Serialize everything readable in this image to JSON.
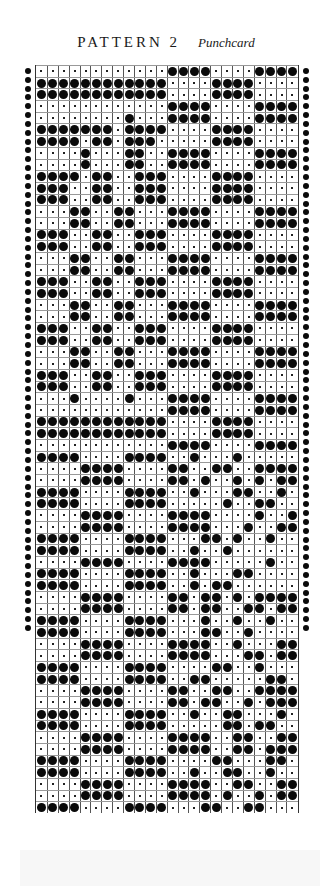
{
  "header": {
    "title": "PATTERN 2",
    "subtitle": "Punchcard"
  },
  "punchcard": {
    "columns": 24,
    "legend": {
      "X": "punched hole",
      ".": "unpunched"
    },
    "rows": [
      "............XXXX....XXXX",
      "XXXXXXXXXXXX....XXXX....",
      "XXXXXXXXXXXX....XXXX....",
      "............XXXX....XXXX",
      "........X...XXXX....XXXX",
      "XXXXXXX.XXXX....XXXX....",
      "XXXX.XX.XXX.....XXXX....",
      "....X...XX..XXXX....XXXX",
      "....X...XX..XXXX....XXXX",
      "XXXX.XX..XXX....XXXX....",
      "XXX..XX..XXX....XXXX....",
      "XXX..XX..XXX....XXXX....",
      "...XX..XX...XXXX....XXXX",
      "...XX..XX...XXXX....XXXX",
      "XXX..XX..XXX....XXXX....",
      "XXX..XX..XXX....XXXX....",
      "...XX..XX...XXXX....XXXX",
      "...XX..XX...XXXX....XXXX",
      "XXX..XX..XXX....XXXX....",
      "XXX..XX..XXX....XXXX....",
      "...XX..XX...XXXX....XXXX",
      "...XX..XX...XXXX....XXXX",
      "XXX..XX..XXX....XXXX....",
      "XXX..XX..XXX....XXXX....",
      "...XX..XX...XXXX....XXXX",
      "...XX..XX...XXXX....XXXX",
      "XXX..XX..XXX....XXXX....",
      "XXX..XX..XXX....XXXX....",
      "...X....X...XXXX....XXXX",
      "............XXXX....XXXX",
      "XXXXXXXXXXXX....XXXX....",
      "XXXXXXXXXXXX....XXXX....",
      "............XXXX....XXXX",
      "XXXX....XXXX..X...X.....",
      "....XXXX....XX..XX..XXXX",
      "....XXXX....XX.X..X.X.XX",
      "XXXX....XXXX..X...XX..X.",
      "XXXX....XXXX.....X..XX..",
      "....XXXX....XXXX....X..X",
      "....XXXX....XXXX...X..XX",
      "XXXX....XXXX...XX.X..X..",
      "XXXX....XXXX..X..X......",
      "....XXXX....XXXX.....X..",
      "XXXX....XXXX..X...XX....",
      "XXXX....XXXX..X.XX......",
      "....XXXX....XX.XX.X.XXXX",
      "....XXXX....XX.XX..XX.XX",
      "XXXX....XXXX...X..X..X..",
      "XXXX....XXXX...XX..X....",
      "....XXXX....XXXX..X...XX",
      "....XXXX....XXXX...XX.XX",
      "XXXX....XXXX....XX..X...",
      "XXXX....XXXX..XX.....XX.",
      "....XXXX....XX..XX..XXXX",
      "....XXXX....XX.XX..X.XXX",
      "XXXX....XXXX..X..XX...X.",
      "XXXX....XXXX.....XX.XX..",
      "....XXXX....XXXX..XX..XX",
      "....XXXX....XXXX..XX.XXX",
      "XXXX....XXXX....XX...XX.",
      "XXXX....XXXX..X..XX..X..",
      "....XXXX....XXXX..XX..XX",
      "....XXXX....XXXX.X..X.XX",
      "XXXX....XXXX...XX..XX..."
    ]
  }
}
